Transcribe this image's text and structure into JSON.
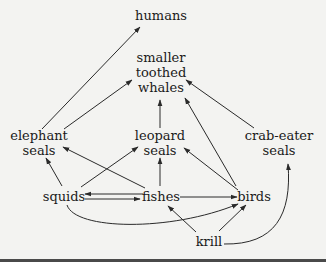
{
  "diagram": {
    "type": "food-web",
    "colors": {
      "background": "#f3f3f1",
      "ink": "#1a1a1a",
      "edge": "#2a2a2a",
      "bottom_bar": "#4a4a4a"
    },
    "nodes": {
      "humans": {
        "lines": [
          "humans"
        ]
      },
      "whales": {
        "lines": [
          "smaller",
          "toothed",
          "whales"
        ]
      },
      "elephant_seals": {
        "lines": [
          "elephant",
          "seals"
        ]
      },
      "leopard_seals": {
        "lines": [
          "leopard",
          "seals"
        ]
      },
      "crab_eater_seals": {
        "lines": [
          "crab-eater",
          "seals"
        ]
      },
      "squids": {
        "lines": [
          "squids"
        ]
      },
      "fishes": {
        "lines": [
          "fishes"
        ]
      },
      "birds": {
        "lines": [
          "birds"
        ]
      },
      "krill": {
        "lines": [
          "krill"
        ]
      }
    },
    "edges": [
      {
        "from": "elephant seals",
        "to": "humans"
      },
      {
        "from": "elephant seals",
        "to": "smaller toothed whales"
      },
      {
        "from": "leopard seals",
        "to": "smaller toothed whales"
      },
      {
        "from": "birds",
        "to": "smaller toothed whales"
      },
      {
        "from": "crab-eater seals",
        "to": "smaller toothed whales"
      },
      {
        "from": "squids",
        "to": "elephant seals"
      },
      {
        "from": "fishes",
        "to": "elephant seals"
      },
      {
        "from": "squids",
        "to": "leopard seals"
      },
      {
        "from": "fishes",
        "to": "leopard seals"
      },
      {
        "from": "birds",
        "to": "leopard seals"
      },
      {
        "from": "squids",
        "to": "fishes"
      },
      {
        "from": "fishes",
        "to": "squids"
      },
      {
        "from": "fishes",
        "to": "birds"
      },
      {
        "from": "squids",
        "to": "birds"
      },
      {
        "from": "krill",
        "to": "fishes"
      },
      {
        "from": "krill",
        "to": "birds"
      },
      {
        "from": "krill",
        "to": "crab-eater seals"
      }
    ]
  }
}
